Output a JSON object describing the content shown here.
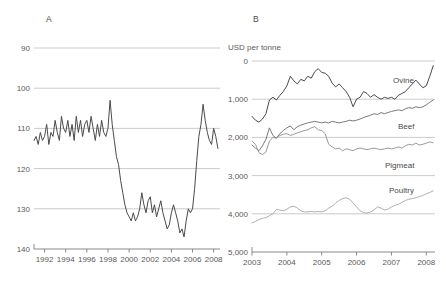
{
  "figure": {
    "panels": [
      {
        "letter": "A",
        "letter_x": 46,
        "letter_y": 14,
        "unit_label": "",
        "plot": {
          "x": 34,
          "y": 48,
          "w": 186,
          "h": 201
        },
        "y_ticks": [
          "140",
          "130",
          "120",
          "110",
          "100",
          "90"
        ],
        "x_ticks": [
          "1992",
          "1994",
          "1996",
          "1998",
          "2000",
          "2002",
          "2004",
          "2006",
          "2008"
        ]
      },
      {
        "letter": "B",
        "letter_x": 253,
        "letter_y": 14,
        "unit_label": "USD per tonne",
        "unit_x": 228,
        "unit_y": 43,
        "plot": {
          "x": 252,
          "y": 61,
          "w": 183,
          "h": 191
        },
        "y_ticks": [
          "5,000",
          "4,000",
          "3,000",
          "2,000",
          "1,000",
          "0"
        ],
        "x_ticks": [
          "2003",
          "2004",
          "2005",
          "2006",
          "2007",
          "2008"
        ],
        "series_labels": [
          {
            "text": "Ovine",
            "x": 393,
            "y": 76
          },
          {
            "text": "Beef",
            "x": 398,
            "y": 122
          },
          {
            "text": "Pigmeat",
            "x": 385,
            "y": 161
          },
          {
            "text": "Poultry",
            "x": 389,
            "y": 186
          }
        ]
      }
    ],
    "colors": {
      "dark_line": "#4a4a4a",
      "mid_line": "#7a7a7a",
      "light_line": "#9a9a9a",
      "grid": "#b5b5b5",
      "axis": "#7d7d7d",
      "text": "#5a5a5a"
    }
  },
  "chart_data": [
    {
      "type": "line",
      "panel": "A",
      "title": "A",
      "xlabel": "",
      "ylabel": "",
      "ylim": [
        90,
        140
      ],
      "xlim": [
        1991.0,
        2008.6
      ],
      "grid": true,
      "legend": "none",
      "yticks": [
        90,
        100,
        110,
        120,
        130,
        140
      ],
      "xticks": [
        1992,
        1994,
        1996,
        1998,
        2000,
        2002,
        2004,
        2006,
        2008
      ],
      "series": [
        {
          "name": "index",
          "color": "#4a4a4a",
          "x": [
            1991.0,
            1991.2,
            1991.4,
            1991.6,
            1991.8,
            1992.0,
            1992.2,
            1992.4,
            1992.6,
            1992.8,
            1993.0,
            1993.2,
            1993.4,
            1993.6,
            1993.8,
            1994.0,
            1994.2,
            1994.4,
            1994.6,
            1994.8,
            1995.0,
            1995.2,
            1995.4,
            1995.6,
            1995.8,
            1996.0,
            1996.2,
            1996.4,
            1996.6,
            1996.8,
            1997.0,
            1997.2,
            1997.4,
            1997.6,
            1997.8,
            1998.0,
            1998.2,
            1998.4,
            1998.6,
            1998.8,
            1999.0,
            1999.2,
            1999.4,
            1999.6,
            1999.8,
            2000.0,
            2000.2,
            2000.4,
            2000.6,
            2000.8,
            2001.0,
            2001.2,
            2001.4,
            2001.6,
            2001.8,
            2002.0,
            2002.2,
            2002.4,
            2002.6,
            2002.8,
            2003.0,
            2003.2,
            2003.4,
            2003.6,
            2003.8,
            2004.0,
            2004.2,
            2004.4,
            2004.6,
            2004.8,
            2005.0,
            2005.2,
            2005.4,
            2005.6,
            2005.8,
            2006.0,
            2006.2,
            2006.4,
            2006.6,
            2006.8,
            2007.0,
            2007.2,
            2007.4,
            2007.6,
            2007.8,
            2008.0,
            2008.2,
            2008.4
          ],
          "y": [
            117,
            118,
            116,
            119,
            117,
            118,
            121,
            116,
            119,
            118,
            122,
            119,
            117,
            123,
            120,
            119,
            122,
            118,
            121,
            117,
            123,
            119,
            122,
            118,
            121,
            122,
            119,
            123,
            120,
            117,
            121,
            118,
            122,
            119,
            118,
            120,
            127,
            121,
            117,
            113,
            111,
            107,
            104,
            101,
            99,
            98,
            97,
            99,
            97,
            98,
            100,
            104,
            101,
            99,
            102,
            103,
            99,
            101,
            98,
            100,
            102,
            99,
            97,
            95,
            96,
            99,
            101,
            99,
            97,
            94,
            95,
            93,
            97,
            100,
            99,
            100,
            105,
            112,
            118,
            121,
            126,
            122,
            119,
            117,
            116,
            120,
            118,
            115,
            117,
            120,
            119,
            122,
            120,
            124,
            128,
            132
          ]
        }
      ]
    },
    {
      "type": "line",
      "panel": "B",
      "title": "B",
      "xlabel": "",
      "ylabel": "USD per tonne",
      "ylim": [
        0,
        5000
      ],
      "xlim": [
        2003.0,
        2008.25
      ],
      "grid": true,
      "legend": "inline-labels",
      "yticks": [
        0,
        1000,
        2000,
        3000,
        4000,
        5000
      ],
      "xticks": [
        2003,
        2004,
        2005,
        2006,
        2007,
        2008
      ],
      "series": [
        {
          "name": "Ovine",
          "color": "#4a4a4a",
          "x": [
            2003.0,
            2003.1,
            2003.2,
            2003.3,
            2003.4,
            2003.5,
            2003.6,
            2003.7,
            2003.8,
            2003.9,
            2004.0,
            2004.1,
            2004.2,
            2004.3,
            2004.4,
            2004.5,
            2004.6,
            2004.7,
            2004.8,
            2004.9,
            2005.0,
            2005.1,
            2005.2,
            2005.3,
            2005.4,
            2005.5,
            2005.6,
            2005.7,
            2005.8,
            2005.9,
            2006.0,
            2006.1,
            2006.2,
            2006.3,
            2006.4,
            2006.5,
            2006.6,
            2006.7,
            2006.8,
            2006.9,
            2007.0,
            2007.1,
            2007.2,
            2007.3,
            2007.4,
            2007.5,
            2007.6,
            2007.7,
            2007.8,
            2007.9,
            2008.0,
            2008.1,
            2008.2
          ],
          "y": [
            3550,
            3450,
            3400,
            3480,
            3620,
            3980,
            4050,
            3980,
            4100,
            4200,
            4350,
            4600,
            4480,
            4400,
            4520,
            4480,
            4600,
            4550,
            4720,
            4800,
            4700,
            4680,
            4600,
            4420,
            4320,
            4400,
            4300,
            4200,
            4050,
            3800,
            4000,
            4050,
            4200,
            4150,
            4050,
            4120,
            4050,
            4000,
            4050,
            4020,
            4050,
            4000,
            4100,
            4150,
            4200,
            4300,
            4400,
            4500,
            4400,
            4300,
            4350,
            4600,
            4880
          ]
        },
        {
          "name": "Beef",
          "color": "#7a7a7a",
          "x": [
            2003.0,
            2003.1,
            2003.2,
            2003.3,
            2003.4,
            2003.5,
            2003.6,
            2003.7,
            2003.8,
            2003.9,
            2004.0,
            2004.1,
            2004.2,
            2004.3,
            2004.4,
            2004.5,
            2004.6,
            2004.7,
            2004.8,
            2004.9,
            2005.0,
            2005.1,
            2005.2,
            2005.3,
            2005.4,
            2005.5,
            2005.6,
            2005.7,
            2005.8,
            2005.9,
            2006.0,
            2006.1,
            2006.2,
            2006.3,
            2006.4,
            2006.5,
            2006.6,
            2006.7,
            2006.8,
            2006.9,
            2007.0,
            2007.1,
            2007.2,
            2007.3,
            2007.4,
            2007.5,
            2007.6,
            2007.7,
            2007.8,
            2007.9,
            2008.0,
            2008.1,
            2008.2
          ],
          "y": [
            2800,
            2720,
            2650,
            2780,
            2950,
            3250,
            3050,
            2980,
            3100,
            3180,
            3250,
            3300,
            3200,
            3280,
            3320,
            3350,
            3380,
            3400,
            3420,
            3400,
            3380,
            3400,
            3380,
            3420,
            3400,
            3380,
            3400,
            3420,
            3450,
            3430,
            3450,
            3480,
            3520,
            3550,
            3580,
            3620,
            3600,
            3650,
            3620,
            3650,
            3680,
            3700,
            3720,
            3700,
            3750,
            3780,
            3760,
            3800,
            3780,
            3800,
            3850,
            3920,
            3980
          ]
        },
        {
          "name": "Pigmeat",
          "color": "#9a9a9a",
          "x": [
            2003.0,
            2003.1,
            2003.2,
            2003.3,
            2003.4,
            2003.5,
            2003.6,
            2003.7,
            2003.8,
            2003.9,
            2004.0,
            2004.1,
            2004.2,
            2004.3,
            2004.4,
            2004.5,
            2004.6,
            2004.7,
            2004.8,
            2004.9,
            2005.0,
            2005.1,
            2005.2,
            2005.3,
            2005.4,
            2005.5,
            2005.6,
            2005.7,
            2005.8,
            2005.9,
            2006.0,
            2006.1,
            2006.2,
            2006.3,
            2006.4,
            2006.5,
            2006.6,
            2006.7,
            2006.8,
            2006.9,
            2007.0,
            2007.1,
            2007.2,
            2007.3,
            2007.4,
            2007.5,
            2007.6,
            2007.7,
            2007.8,
            2007.9,
            2008.0,
            2008.1,
            2008.2
          ],
          "y": [
            2900,
            2820,
            2600,
            2550,
            2620,
            2900,
            3000,
            2980,
            3050,
            3080,
            3100,
            3050,
            3080,
            3120,
            3150,
            3180,
            3200,
            3250,
            3280,
            3200,
            3180,
            3100,
            2820,
            2750,
            2700,
            2720,
            2650,
            2700,
            2680,
            2650,
            2700,
            2720,
            2700,
            2680,
            2700,
            2720,
            2700,
            2680,
            2700,
            2720,
            2700,
            2720,
            2750,
            2720,
            2780,
            2820,
            2800,
            2850,
            2800,
            2820,
            2850,
            2880,
            2860
          ]
        },
        {
          "name": "Poultry",
          "color": "#b0b0b0",
          "x": [
            2003.0,
            2003.1,
            2003.2,
            2003.3,
            2003.4,
            2003.5,
            2003.6,
            2003.7,
            2003.8,
            2003.9,
            2004.0,
            2004.1,
            2004.2,
            2004.3,
            2004.4,
            2004.5,
            2004.6,
            2004.7,
            2004.8,
            2004.9,
            2005.0,
            2005.1,
            2005.2,
            2005.3,
            2005.4,
            2005.5,
            2005.6,
            2005.7,
            2005.8,
            2005.9,
            2006.0,
            2006.1,
            2006.2,
            2006.3,
            2006.4,
            2006.5,
            2006.6,
            2006.7,
            2006.8,
            2006.9,
            2007.0,
            2007.1,
            2007.2,
            2007.3,
            2007.4,
            2007.5,
            2007.6,
            2007.7,
            2007.8,
            2007.9,
            2008.0,
            2008.1,
            2008.2
          ],
          "y": [
            760,
            800,
            850,
            880,
            900,
            950,
            1000,
            1120,
            1100,
            1080,
            1120,
            1180,
            1200,
            1150,
            1080,
            1050,
            1050,
            1060,
            1050,
            1060,
            1050,
            1080,
            1150,
            1200,
            1280,
            1350,
            1400,
            1420,
            1380,
            1280,
            1180,
            1080,
            1030,
            1020,
            1050,
            1100,
            1180,
            1150,
            1100,
            1120,
            1180,
            1220,
            1250,
            1300,
            1350,
            1380,
            1400,
            1420,
            1450,
            1480,
            1520,
            1560,
            1600
          ]
        }
      ]
    }
  ]
}
